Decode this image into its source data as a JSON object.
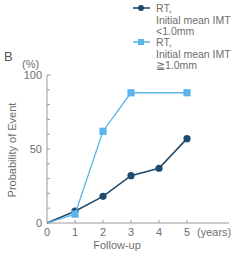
{
  "panel_label": "B",
  "chart_data": {
    "type": "line",
    "title": "",
    "xlabel": "Follow-up",
    "x_unit_label": "(years)",
    "ylabel": "Probability of Event",
    "y_unit_label": "(%)",
    "x": [
      0,
      1,
      2,
      3,
      4,
      5
    ],
    "x_tick_labels": [
      "0",
      "1",
      "2",
      "3",
      "4",
      "5"
    ],
    "y_tick_labels": [
      "0",
      "50",
      "100"
    ],
    "y_ticks": [
      0,
      50,
      100
    ],
    "y_minor_step": 10,
    "xlim": [
      0,
      6.5
    ],
    "ylim": [
      0,
      100
    ],
    "grid": false,
    "legend_position": "top-right",
    "series": [
      {
        "name": "RT, Initial mean IMT <1.0mm",
        "legend_lines": [
          "RT,",
          "Initial mean IMT",
          "<1.0mm"
        ],
        "marker": "circle",
        "color": "#1f4b6e",
        "values": [
          0,
          8,
          18,
          32,
          37,
          57
        ]
      },
      {
        "name": "RT, Initial mean IMT ≧1.0mm",
        "legend_lines": [
          "RT,",
          "Initial mean IMT",
          "≧1.0mm"
        ],
        "marker": "square",
        "color": "#5bb5ea",
        "values": [
          0,
          6,
          62,
          88,
          null,
          88
        ]
      }
    ]
  }
}
